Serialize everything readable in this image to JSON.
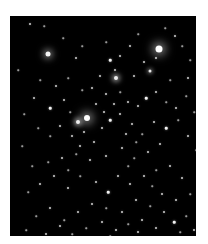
{
  "caption": {
    "text": ""
  },
  "image": {
    "alt": "Telescope image of an open star cluster on a black sky",
    "background": "#000000",
    "frame": {
      "left": 10,
      "top": 16,
      "width": 186,
      "height": 220
    },
    "bright_stars": [
      {
        "x": 149,
        "y": 33,
        "size": 7,
        "glow": 10,
        "color": "#ffffff"
      },
      {
        "x": 38,
        "y": 38,
        "size": 5,
        "glow": 7,
        "color": "#f4f4f4"
      },
      {
        "x": 77,
        "y": 102,
        "size": 6,
        "glow": 10,
        "color": "#ffffff"
      },
      {
        "x": 68,
        "y": 106,
        "size": 4,
        "glow": 5,
        "color": "#eeeeee"
      },
      {
        "x": 106,
        "y": 62,
        "size": 4,
        "glow": 5,
        "color": "#eeeeee"
      },
      {
        "x": 140,
        "y": 55,
        "size": 3,
        "glow": 4,
        "color": "#e8e8e8"
      }
    ],
    "stars": [
      [
        20,
        8,
        2
      ],
      [
        34,
        10,
        1.5
      ],
      [
        53,
        22,
        1.5
      ],
      [
        72,
        30,
        1.5
      ],
      [
        66,
        42,
        2
      ],
      [
        96,
        26,
        1.5
      ],
      [
        100,
        44,
        2.5
      ],
      [
        105,
        54,
        2
      ],
      [
        110,
        40,
        2
      ],
      [
        128,
        18,
        1.5
      ],
      [
        120,
        30,
        2
      ],
      [
        155,
        12,
        1.5
      ],
      [
        165,
        20,
        2
      ],
      [
        172,
        30,
        1.5
      ],
      [
        180,
        44,
        1.5
      ],
      [
        178,
        62,
        2
      ],
      [
        160,
        64,
        1.5
      ],
      [
        146,
        42,
        2
      ],
      [
        134,
        46,
        2
      ],
      [
        124,
        60,
        2
      ],
      [
        90,
        60,
        2
      ],
      [
        82,
        72,
        2
      ],
      [
        72,
        74,
        1.5
      ],
      [
        96,
        78,
        2
      ],
      [
        110,
        76,
        1.5
      ],
      [
        118,
        86,
        2
      ],
      [
        128,
        90,
        2
      ],
      [
        136,
        82,
        2.5
      ],
      [
        146,
        76,
        2
      ],
      [
        156,
        86,
        1.5
      ],
      [
        166,
        92,
        2
      ],
      [
        176,
        80,
        1.5
      ],
      [
        58,
        62,
        1.5
      ],
      [
        46,
        70,
        2
      ],
      [
        30,
        64,
        1.5
      ],
      [
        24,
        82,
        2
      ],
      [
        14,
        98,
        1.5
      ],
      [
        40,
        92,
        2.5
      ],
      [
        54,
        84,
        2
      ],
      [
        60,
        96,
        1.5
      ],
      [
        50,
        110,
        2
      ],
      [
        40,
        120,
        1.5
      ],
      [
        28,
        112,
        1.5
      ],
      [
        62,
        120,
        2
      ],
      [
        74,
        116,
        2
      ],
      [
        84,
        126,
        2
      ],
      [
        92,
        112,
        2
      ],
      [
        100,
        104,
        2.5
      ],
      [
        110,
        98,
        2
      ],
      [
        122,
        108,
        2
      ],
      [
        132,
        118,
        1.5
      ],
      [
        144,
        106,
        2
      ],
      [
        156,
        112,
        2.5
      ],
      [
        168,
        104,
        1.5
      ],
      [
        178,
        120,
        2
      ],
      [
        186,
        134,
        1.5
      ],
      [
        150,
        128,
        2
      ],
      [
        138,
        136,
        2
      ],
      [
        124,
        142,
        1.5
      ],
      [
        112,
        132,
        2
      ],
      [
        96,
        140,
        2
      ],
      [
        80,
        144,
        2
      ],
      [
        66,
        138,
        1.5
      ],
      [
        52,
        142,
        2
      ],
      [
        38,
        146,
        1.5
      ],
      [
        22,
        150,
        1.5
      ],
      [
        30,
        168,
        2
      ],
      [
        44,
        160,
        2
      ],
      [
        58,
        172,
        2
      ],
      [
        70,
        160,
        1.5
      ],
      [
        86,
        166,
        2
      ],
      [
        98,
        176,
        2.5
      ],
      [
        108,
        160,
        2
      ],
      [
        120,
        168,
        2
      ],
      [
        134,
        160,
        2
      ],
      [
        146,
        154,
        1.5
      ],
      [
        160,
        150,
        2
      ],
      [
        172,
        162,
        2
      ],
      [
        180,
        178,
        1.5
      ],
      [
        166,
        184,
        2
      ],
      [
        152,
        178,
        2
      ],
      [
        140,
        190,
        1.5
      ],
      [
        126,
        184,
        2
      ],
      [
        112,
        196,
        2
      ],
      [
        96,
        192,
        1.5
      ],
      [
        82,
        188,
        2
      ],
      [
        68,
        196,
        2
      ],
      [
        54,
        204,
        1.5
      ],
      [
        40,
        192,
        2
      ],
      [
        26,
        200,
        1.5
      ],
      [
        16,
        214,
        1.5
      ],
      [
        36,
        218,
        2
      ],
      [
        50,
        210,
        2
      ],
      [
        76,
        212,
        1.5
      ],
      [
        92,
        206,
        2
      ],
      [
        106,
        214,
        2
      ],
      [
        118,
        208,
        1.5
      ],
      [
        132,
        204,
        2
      ],
      [
        146,
        212,
        2
      ],
      [
        164,
        206,
        2.5
      ],
      [
        176,
        200,
        1.5
      ],
      [
        184,
        214,
        2
      ],
      [
        170,
        216,
        1.5
      ],
      [
        128,
        216,
        2
      ],
      [
        100,
        220,
        1.5
      ],
      [
        62,
        218,
        1.5
      ],
      [
        12,
        130,
        1.5
      ],
      [
        18,
        176,
        1.5
      ],
      [
        8,
        54,
        1.5
      ],
      [
        184,
        96,
        1.5
      ],
      [
        86,
        88,
        2
      ],
      [
        94,
        96,
        2
      ],
      [
        104,
        88,
        2
      ],
      [
        116,
        118,
        2
      ],
      [
        126,
        126,
        1.5
      ],
      [
        70,
        130,
        2
      ],
      [
        58,
        154,
        1.5
      ],
      [
        142,
        170,
        1.5
      ],
      [
        154,
        196,
        2
      ],
      [
        118,
        150,
        1.5
      ]
    ]
  }
}
